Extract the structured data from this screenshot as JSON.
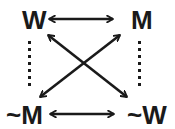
{
  "diagram": {
    "type": "square-of-opposition",
    "colors": {
      "ink": "#1a1a1a",
      "background": "#ffffff"
    },
    "nodes": {
      "top_left": {
        "label": "W",
        "x": 22,
        "y": 29
      },
      "top_right": {
        "label": "M",
        "x": 131,
        "y": 29
      },
      "bottom_left": {
        "label": "~M",
        "x": 6,
        "y": 124
      },
      "bottom_right": {
        "label": "~W",
        "x": 127,
        "y": 124
      }
    },
    "edges": [
      {
        "id": "top",
        "from": "W",
        "to": "M",
        "style": "double-arrow"
      },
      {
        "id": "bottom",
        "from": "~M",
        "to": "~W",
        "style": "double-arrow"
      },
      {
        "id": "diagonal-1",
        "from": "W",
        "to": "~W",
        "style": "double-arrow"
      },
      {
        "id": "diagonal-2",
        "from": "M",
        "to": "~M",
        "style": "double-arrow"
      },
      {
        "id": "left-side",
        "from": "W",
        "to": "~M",
        "style": "dotted"
      },
      {
        "id": "right-side",
        "from": "M",
        "to": "~W",
        "style": "dotted"
      }
    ]
  }
}
